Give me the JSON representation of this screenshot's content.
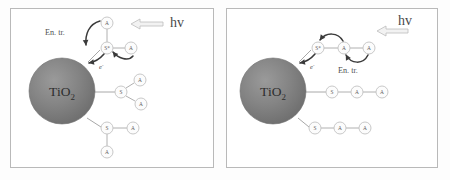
{
  "figure": {
    "title": "",
    "background_color": "#fdfdfd",
    "panel_border_color": "#b9b9b9",
    "sphere_color": "#7f7f7f",
    "node_outline_color": "#c2c2c2",
    "arrow_color": "#3a3a3a",
    "hv_arrow_fill": "#f2f2f2"
  },
  "panels": [
    {
      "id": "left-panel",
      "name": "branched-antenna-panel",
      "core_label": "TiO",
      "core_subscript": "2",
      "excitation_label": "hv",
      "energy_transfer_label": "En. tr.",
      "electron_label": "e",
      "electron_superscript": "-",
      "nodes": [
        {
          "id": "L-A-top",
          "label": "A",
          "cx": 107,
          "cy": 23
        },
        {
          "id": "L-S-star",
          "label": "S*",
          "cx": 107,
          "cy": 48
        },
        {
          "id": "L-A-right",
          "label": "A",
          "cx": 131,
          "cy": 48
        },
        {
          "id": "L-A-mid-upper",
          "label": "A",
          "cx": 140,
          "cy": 80
        },
        {
          "id": "L-S-mid",
          "label": "S",
          "cx": 121,
          "cy": 92
        },
        {
          "id": "L-A-mid-lower",
          "label": "A",
          "cx": 141,
          "cy": 104
        },
        {
          "id": "L-S-bottom",
          "label": "S",
          "cx": 107,
          "cy": 128
        },
        {
          "id": "L-A-bottom-right",
          "label": "A",
          "cx": 133,
          "cy": 128
        },
        {
          "id": "L-A-bottom",
          "label": "A",
          "cx": 107,
          "cy": 152
        }
      ],
      "bonds": [
        {
          "from": "L-A-top",
          "to": "L-S-star"
        },
        {
          "from": "L-S-star",
          "to": "L-A-right"
        },
        {
          "from": "L-S-mid",
          "to": "L-A-mid-upper"
        },
        {
          "from": "L-S-mid",
          "to": "L-A-mid-lower"
        },
        {
          "from": "L-S-bottom",
          "to": "L-A-bottom-right"
        },
        {
          "from": "L-S-bottom",
          "to": "L-A-bottom"
        }
      ]
    },
    {
      "id": "right-panel",
      "name": "linear-antenna-panel",
      "core_label": "TiO",
      "core_subscript": "2",
      "excitation_label": "hv",
      "energy_transfer_label": "En. tr.",
      "electron_label": "e",
      "electron_superscript": "-",
      "nodes": [
        {
          "id": "R-S-star",
          "label": "S*",
          "cx": 318,
          "cy": 48
        },
        {
          "id": "R-A-1",
          "label": "A",
          "cx": 344,
          "cy": 48
        },
        {
          "id": "R-A-2",
          "label": "A",
          "cx": 369,
          "cy": 48
        },
        {
          "id": "R-S-mid",
          "label": "S",
          "cx": 332,
          "cy": 92
        },
        {
          "id": "R-A-mid-1",
          "label": "A",
          "cx": 357,
          "cy": 92
        },
        {
          "id": "R-A-mid-2",
          "label": "A",
          "cx": 382,
          "cy": 92
        },
        {
          "id": "R-S-bottom",
          "label": "S",
          "cx": 315,
          "cy": 128
        },
        {
          "id": "R-A-bottom-1",
          "label": "A",
          "cx": 340,
          "cy": 128
        },
        {
          "id": "R-A-bottom-2",
          "label": "A",
          "cx": 365,
          "cy": 128
        }
      ],
      "bonds": [
        {
          "from": "R-S-star",
          "to": "R-A-1"
        },
        {
          "from": "R-A-1",
          "to": "R-A-2"
        },
        {
          "from": "R-S-mid",
          "to": "R-A-mid-1"
        },
        {
          "from": "R-A-mid-1",
          "to": "R-A-mid-2"
        },
        {
          "from": "R-S-bottom",
          "to": "R-A-bottom-1"
        },
        {
          "from": "R-A-bottom-1",
          "to": "R-A-bottom-2"
        }
      ]
    }
  ]
}
